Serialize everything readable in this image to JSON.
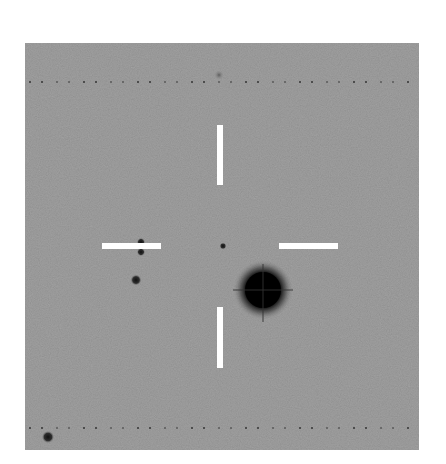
{
  "image": {
    "description": "Grayscale astronomical finding chart with four white crosshair tick marks indicating a target near center",
    "background_color": "#8f8f8f",
    "marker_color": "#ffffff",
    "star_color": "#000000"
  },
  "frame": {
    "x": 25,
    "y": 43,
    "width": 394,
    "height": 407
  },
  "markers": [
    {
      "name": "top",
      "x": 217,
      "y": 125,
      "width": 6,
      "height": 60
    },
    {
      "name": "bottom",
      "x": 217,
      "y": 307,
      "width": 6,
      "height": 61
    },
    {
      "name": "left",
      "x": 102,
      "y": 243,
      "width": 59,
      "height": 6
    },
    {
      "name": "right",
      "x": 279,
      "y": 243,
      "width": 59,
      "height": 6
    }
  ],
  "stars": [
    {
      "name": "bright-star",
      "cx": 263,
      "cy": 290,
      "r": 18,
      "halo": 30
    },
    {
      "name": "target-star",
      "cx": 223,
      "cy": 246,
      "r": 2.5
    },
    {
      "name": "star-left-upper",
      "cx": 141,
      "cy": 242,
      "r": 3
    },
    {
      "name": "star-left-lower",
      "cx": 141,
      "cy": 252,
      "r": 3
    },
    {
      "name": "star-left",
      "cx": 136,
      "cy": 280,
      "r": 4
    },
    {
      "name": "star-bottom-left",
      "cx": 48,
      "cy": 437,
      "r": 4.5
    },
    {
      "name": "faint-top",
      "cx": 219,
      "cy": 75,
      "r": 3.5,
      "faint": true
    }
  ],
  "dotted_rows": [
    82,
    428
  ]
}
